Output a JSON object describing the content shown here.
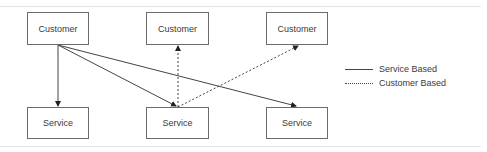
{
  "diagram": {
    "nodes": [
      {
        "id": "c1",
        "label": "Customer",
        "x": 27,
        "y": 12,
        "w": 62,
        "h": 33
      },
      {
        "id": "c2",
        "label": "Customer",
        "x": 146,
        "y": 12,
        "w": 63,
        "h": 33
      },
      {
        "id": "c3",
        "label": "Customer",
        "x": 266,
        "y": 12,
        "w": 62,
        "h": 33
      },
      {
        "id": "s1",
        "label": "Service",
        "x": 27,
        "y": 107,
        "w": 62,
        "h": 32
      },
      {
        "id": "s2",
        "label": "Service",
        "x": 146,
        "y": 107,
        "w": 63,
        "h": 32
      },
      {
        "id": "s3",
        "label": "Service",
        "x": 266,
        "y": 107,
        "w": 62,
        "h": 32
      }
    ],
    "edges": [
      {
        "from": "c1",
        "to": "s1",
        "style": "solid"
      },
      {
        "from": "c1",
        "to": "s2",
        "style": "solid"
      },
      {
        "from": "c1",
        "to": "s3",
        "style": "solid"
      },
      {
        "from": "s2",
        "to": "c2",
        "style": "dotted"
      },
      {
        "from": "s2",
        "to": "c3",
        "style": "dotted"
      }
    ],
    "legend": [
      {
        "style": "solid",
        "label": "Service Based"
      },
      {
        "style": "dotted",
        "label": "Customer Based"
      }
    ],
    "colors": {
      "line": "#444444",
      "box_border": "#6b6b6b",
      "text": "#3a3a3a",
      "frame": "#e4e4e4"
    }
  }
}
